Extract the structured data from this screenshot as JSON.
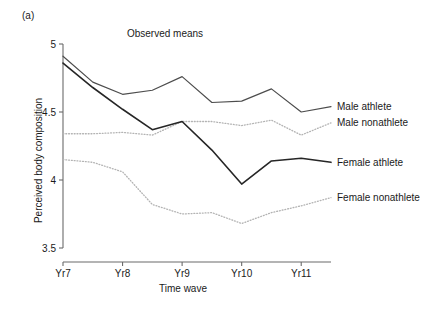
{
  "figure": {
    "panel_label": "(a)",
    "title": "Observed means",
    "x_axis_title": "Time wave",
    "y_axis_title": "Perceived body composition"
  },
  "chart_data": {
    "type": "line",
    "title": "Observed means",
    "xlabel": "Time wave",
    "ylabel": "Perceived body composition",
    "grid": false,
    "legend_position": "right-inline",
    "xlim": [
      0,
      9
    ],
    "ylim": [
      3.5,
      5.0
    ],
    "ytick_labels": [
      "3.5",
      "4",
      "4.5",
      "5"
    ],
    "ytick_values": [
      3.5,
      4.0,
      4.5,
      5.0
    ],
    "xtick_labels": [
      "Yr7",
      "Yr8",
      "Yr9",
      "Yr10",
      "Yr11"
    ],
    "xtick_values": [
      0,
      2,
      4,
      6,
      8
    ],
    "x": [
      0,
      1,
      2,
      3,
      4,
      5,
      6,
      7,
      8,
      9
    ],
    "series": [
      {
        "name": "Male athlete",
        "style": "solid",
        "color": "#4d4d4d",
        "width": 1.2,
        "values": [
          4.91,
          4.72,
          4.63,
          4.66,
          4.76,
          4.57,
          4.58,
          4.67,
          4.5,
          4.54
        ]
      },
      {
        "name": "Male nonathlete",
        "style": "dotted",
        "color": "#b3b3b3",
        "width": 1.3,
        "values": [
          4.34,
          4.34,
          4.35,
          4.33,
          4.43,
          4.43,
          4.4,
          4.44,
          4.33,
          4.42
        ]
      },
      {
        "name": "Female athlete",
        "style": "solid",
        "color": "#262626",
        "width": 1.6,
        "values": [
          4.86,
          4.68,
          4.52,
          4.37,
          4.43,
          4.22,
          3.97,
          4.14,
          4.16,
          4.13
        ]
      },
      {
        "name": "Female nonathlete",
        "style": "dotted",
        "color": "#b3b3b3",
        "width": 1.3,
        "values": [
          4.15,
          4.13,
          4.06,
          3.82,
          3.75,
          3.76,
          3.68,
          3.76,
          3.81,
          3.87
        ]
      }
    ],
    "legend_entries": [
      {
        "label": "Male athlete",
        "y_value": 4.54
      },
      {
        "label": "Male nonathlete",
        "y_value": 4.42
      },
      {
        "label": "Female athlete",
        "y_value": 4.13
      },
      {
        "label": "Female nonathlete",
        "y_value": 3.87
      }
    ]
  }
}
